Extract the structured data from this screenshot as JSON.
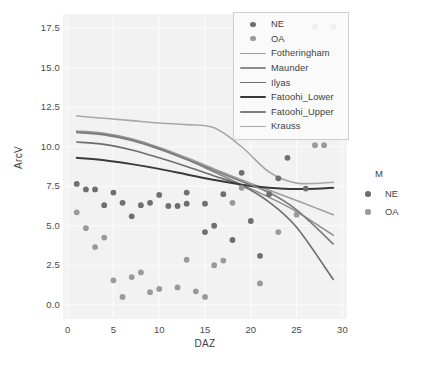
{
  "chart_data": {
    "type": "scatter",
    "title": "",
    "xlabel": "DAZ",
    "ylabel": "ArcV",
    "xlim": [
      -0.5,
      30.5
    ],
    "ylim": [
      -0.9,
      18.4
    ],
    "xticks": [
      0,
      5,
      10,
      15,
      20,
      25,
      30
    ],
    "yticks": [
      "0.0",
      "2.5",
      "5.0",
      "7.5",
      "10.0",
      "12.5",
      "15.0",
      "17.5"
    ],
    "grid": true,
    "panel_background": "#f2f2f2",
    "grid_color": "#fbfbfb",
    "legend_position": "top-right-inside",
    "groups": [
      {
        "name": "NE",
        "color": "#6f6f6f",
        "points": [
          [
            1,
            7.65
          ],
          [
            2,
            7.3
          ],
          [
            3,
            7.3
          ],
          [
            4,
            6.3
          ],
          [
            5,
            7.1
          ],
          [
            6,
            6.45
          ],
          [
            7,
            5.6
          ],
          [
            8,
            6.3
          ],
          [
            9,
            6.45
          ],
          [
            10,
            6.95
          ],
          [
            11,
            6.25
          ],
          [
            12,
            6.25
          ],
          [
            13,
            7.1
          ],
          [
            13,
            6.4
          ],
          [
            15,
            6.4
          ],
          [
            16,
            5.0
          ],
          [
            17,
            7.0
          ],
          [
            18,
            4.1
          ],
          [
            19,
            8.35
          ],
          [
            20,
            5.3
          ],
          [
            21,
            3.1
          ],
          [
            22,
            7.0
          ],
          [
            23,
            8.0
          ],
          [
            24,
            9.3
          ],
          [
            26,
            7.35
          ],
          [
            15,
            4.6
          ]
        ]
      },
      {
        "name": "OA",
        "color": "#9a9a9a",
        "points": [
          [
            1,
            5.85
          ],
          [
            2,
            4.85
          ],
          [
            3,
            3.65
          ],
          [
            4,
            4.25
          ],
          [
            5,
            1.55
          ],
          [
            6,
            0.5
          ],
          [
            7,
            1.75
          ],
          [
            8,
            2.05
          ],
          [
            9,
            0.8
          ],
          [
            10,
            1.0
          ],
          [
            12,
            1.1
          ],
          [
            13,
            2.85
          ],
          [
            14,
            0.85
          ],
          [
            15,
            0.5
          ],
          [
            16,
            2.5
          ],
          [
            17,
            2.8
          ],
          [
            18,
            6.45
          ],
          [
            19,
            7.4
          ],
          [
            21,
            1.35
          ],
          [
            23,
            4.6
          ],
          [
            25,
            5.7
          ],
          [
            27,
            10.1
          ],
          [
            28,
            10.1
          ],
          [
            27,
            17.6
          ],
          [
            29,
            17.6
          ]
        ]
      }
    ],
    "curves": [
      {
        "name": "Fotheringham",
        "color": "#9b9b9b",
        "width": 1.5,
        "points": [
          [
            1,
            11.0
          ],
          [
            4,
            10.85
          ],
          [
            7,
            10.5
          ],
          [
            10,
            9.95
          ],
          [
            13,
            9.3
          ],
          [
            16,
            8.6
          ],
          [
            19,
            7.9
          ],
          [
            22,
            7.25
          ],
          [
            25,
            6.6
          ],
          [
            29,
            5.7
          ]
        ]
      },
      {
        "name": "Maunder",
        "color": "#8b8b8b",
        "width": 1.5,
        "points": [
          [
            1,
            10.95
          ],
          [
            4,
            10.8
          ],
          [
            7,
            10.45
          ],
          [
            10,
            9.9
          ],
          [
            13,
            9.2
          ],
          [
            16,
            8.4
          ],
          [
            19,
            7.6
          ],
          [
            22,
            6.8
          ],
          [
            25,
            5.9
          ],
          [
            29,
            4.4
          ]
        ]
      },
      {
        "name": "Ilyas",
        "color": "#6d6d6d",
        "width": 1.6,
        "points": [
          [
            1,
            10.3
          ],
          [
            4,
            10.15
          ],
          [
            7,
            9.8
          ],
          [
            10,
            9.3
          ],
          [
            13,
            8.75
          ],
          [
            16,
            8.15
          ],
          [
            19,
            7.55
          ],
          [
            22,
            6.5
          ],
          [
            25,
            4.9
          ],
          [
            29,
            1.6
          ]
        ]
      },
      {
        "name": "Fatoohi_Lower",
        "color": "#3a3a3a",
        "width": 2.0,
        "points": [
          [
            1,
            9.3
          ],
          [
            4,
            9.15
          ],
          [
            7,
            8.9
          ],
          [
            10,
            8.6
          ],
          [
            13,
            8.25
          ],
          [
            16,
            7.9
          ],
          [
            19,
            7.6
          ],
          [
            22,
            7.4
          ],
          [
            25,
            7.32
          ],
          [
            29,
            7.4
          ]
        ]
      },
      {
        "name": "Fatoohi_Upper",
        "color": "#7d7d7d",
        "width": 1.7,
        "points": [
          [
            1,
            10.9
          ],
          [
            4,
            10.75
          ],
          [
            7,
            10.4
          ],
          [
            10,
            9.85
          ],
          [
            13,
            9.2
          ],
          [
            16,
            8.5
          ],
          [
            19,
            7.8
          ],
          [
            22,
            7.1
          ],
          [
            25,
            6.0
          ],
          [
            29,
            3.85
          ]
        ]
      },
      {
        "name": "Krauss",
        "color": "#a8a8a8",
        "width": 1.6,
        "points": [
          [
            1,
            11.95
          ],
          [
            4,
            11.8
          ],
          [
            7,
            11.65
          ],
          [
            10,
            11.5
          ],
          [
            13,
            11.4
          ],
          [
            16,
            11.2
          ],
          [
            19,
            10.0
          ],
          [
            22,
            8.4
          ],
          [
            25,
            7.7
          ],
          [
            29,
            7.75
          ]
        ]
      }
    ],
    "legend_inner": {
      "items": [
        {
          "label": "NE",
          "key": "dot",
          "color": "#6f6f6f"
        },
        {
          "label": "OA",
          "key": "dot",
          "color": "#9a9a9a"
        },
        {
          "label": "Fotheringham",
          "key": "line",
          "color": "#9b9b9b",
          "width": 1.5
        },
        {
          "label": "Maunder",
          "key": "line",
          "color": "#8b8b8b",
          "width": 1.5
        },
        {
          "label": "Ilyas",
          "key": "line",
          "color": "#6d6d6d",
          "width": 1.6
        },
        {
          "label": "Fatoohi_Lower",
          "key": "line",
          "color": "#3a3a3a",
          "width": 2.2
        },
        {
          "label": "Fatoohi_Upper",
          "key": "line",
          "color": "#7d7d7d",
          "width": 1.7
        },
        {
          "label": "Krauss",
          "key": "line",
          "color": "#a8a8a8",
          "width": 1.6
        }
      ]
    },
    "legend_outer": {
      "title": "M",
      "items": [
        {
          "label": "NE",
          "color": "#6f6f6f"
        },
        {
          "label": "OA",
          "color": "#9a9a9a"
        }
      ]
    }
  }
}
